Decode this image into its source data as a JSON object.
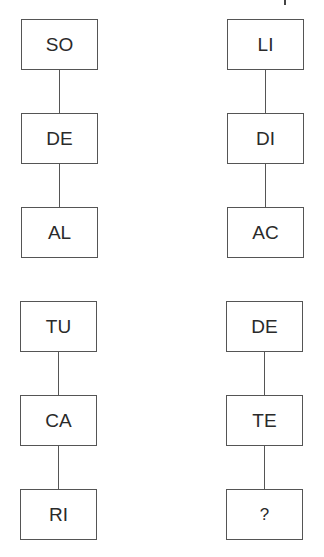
{
  "puzzle": {
    "groups": [
      {
        "column": "left",
        "boxes": [
          "SO",
          "DE",
          "AL"
        ]
      },
      {
        "column": "right",
        "boxes": [
          "LI",
          "DI",
          "AC"
        ]
      },
      {
        "column": "left",
        "boxes": [
          "TU",
          "CA",
          "RI"
        ]
      },
      {
        "column": "right",
        "boxes": [
          "DE",
          "TE",
          "?"
        ]
      }
    ]
  }
}
